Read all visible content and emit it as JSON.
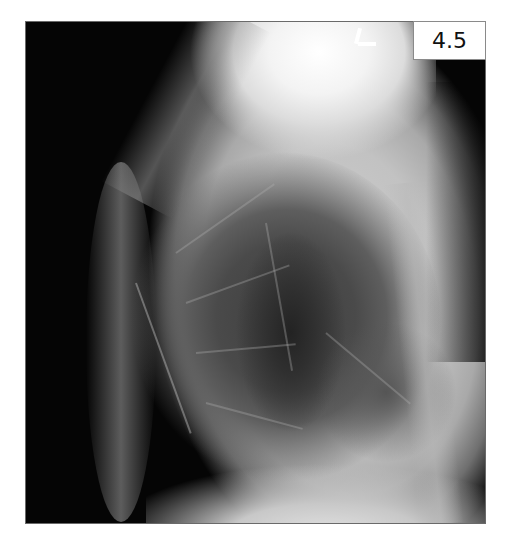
{
  "figure": {
    "label": "4.5",
    "colors": {
      "background": "#050505",
      "soft_tissue": "#c2c2c2",
      "lung_field": "#3e3e3e",
      "label_bg": "#ffffff",
      "label_text": "#111111"
    }
  }
}
